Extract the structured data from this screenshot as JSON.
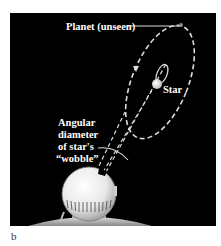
{
  "figure": {
    "panel_label": "b",
    "background": "#000000",
    "labels": {
      "planet": "Planet (unseen)",
      "star": "Star",
      "angular_line1": "Angular",
      "angular_line2": "diameter",
      "angular_line3": "of star's",
      "angular_line4": "“wobble”"
    },
    "elements": [
      "planet-orbit-ellipse",
      "star-wobble-ellipse",
      "star",
      "planet",
      "sight-lines",
      "wobble-angle-arc",
      "observatory-dome",
      "ground"
    ]
  }
}
